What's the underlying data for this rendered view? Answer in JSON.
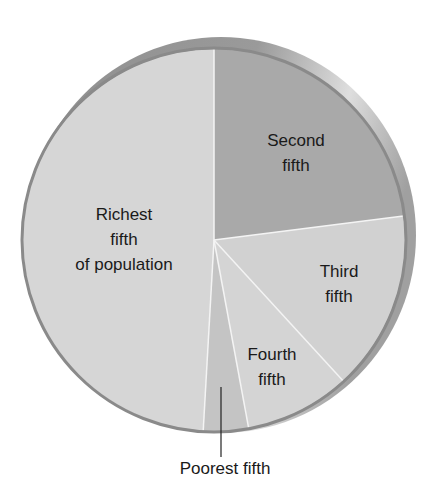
{
  "chart_data": {
    "type": "pie",
    "title": "",
    "categories": [
      "Richest fifth of population",
      "Second fifth",
      "Third fifth",
      "Fourth fifth",
      "Poorest fifth"
    ],
    "values": [
      49.1,
      23.0,
      15.2,
      8.9,
      3.8
    ],
    "unit": "percent (estimated from slice angles)",
    "start_angle_deg": 0,
    "direction": "clockwise from top, starting with Second fifth",
    "slice_order_clockwise": [
      "Second fifth",
      "Third fifth",
      "Fourth fifth",
      "Poorest fifth",
      "Richest fifth of population"
    ],
    "colors": {
      "Richest fifth of population": "#d6d6d6",
      "Second fifth": "#a9a9a9",
      "Third fifth": "#d1d1d1",
      "Fourth fifth": "#d4d4d4",
      "Poorest fifth": "#c4c4c4"
    },
    "legend": "none (direct labels)"
  },
  "labels": {
    "richest": [
      "Richest",
      "fifth",
      "of population"
    ],
    "second": [
      "Second",
      "fifth"
    ],
    "third": [
      "Third",
      "fifth"
    ],
    "fourth": [
      "Fourth",
      "fifth"
    ],
    "poorest": "Poorest fifth"
  },
  "style": {
    "rim_dark": "#8c8c8c",
    "rim_light": "#e2e2e2",
    "outline": "#8a8a8a",
    "divider": "#f4f4f4",
    "text": "#1a1a1a"
  }
}
